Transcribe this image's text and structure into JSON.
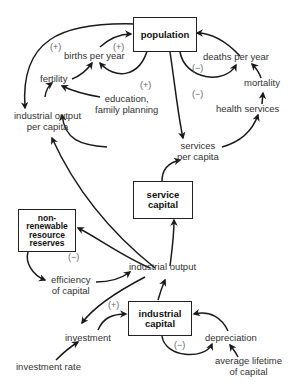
{
  "diagram": {
    "type": "causal-loop",
    "stocks": {
      "population": "population",
      "service_capital": "service\ncapital",
      "nonrenewable": "non-\nrenewable\nresource\nreserves",
      "industrial_capital": "industrial\ncapital"
    },
    "variables": {
      "births_per_year": "births per year",
      "deaths_per_year": "deaths per year",
      "fertility": "fertility",
      "mortality": "mortality",
      "education": "education,\nfamily planning",
      "health_services": "health services",
      "industrial_output_per_capita": "industrial output\nper capita",
      "services_per_capita": "services\nper capita",
      "industrial_output": "industrial output",
      "efficiency_of_capital": "efficiency\nof capital",
      "investment": "investment",
      "investment_rate": "investment rate",
      "depreciation": "depreciation",
      "average_lifetime": "average lifetime\nof capital"
    },
    "polarity": {
      "births_loop_left": "(+)",
      "births_loop_right": "(+)",
      "education_loop": "(+)",
      "deaths_loop": "(−)",
      "health_loop": "(−)",
      "resource_loop": "(−)",
      "investment_loop": "(+)",
      "depreciation_loop": "(−)"
    },
    "colors": {
      "line": "#1a1a1a",
      "text": "#333333",
      "sign": "#666666"
    }
  }
}
